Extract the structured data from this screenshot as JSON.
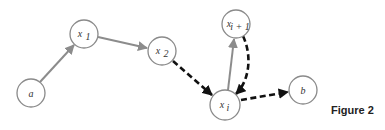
{
  "figure": {
    "label": "Figure 2"
  },
  "nodes": [
    {
      "id": "a",
      "label": "a",
      "subscript": "",
      "cx": 31,
      "cy": 93,
      "r": 14
    },
    {
      "id": "x1",
      "label": "x",
      "subscript": "1",
      "cx": 84,
      "cy": 34,
      "r": 14
    },
    {
      "id": "x2",
      "label": "x",
      "subscript": "2",
      "cx": 162,
      "cy": 51,
      "r": 14
    },
    {
      "id": "xi1",
      "label": "x",
      "subscript": "i + 1",
      "cx": 236,
      "cy": 24,
      "r": 14
    },
    {
      "id": "xi",
      "label": "x",
      "subscript": "i",
      "cx": 225,
      "cy": 105,
      "r": 15
    },
    {
      "id": "b",
      "label": "b",
      "subscript": "",
      "cx": 303,
      "cy": 90,
      "r": 14
    }
  ],
  "edges": [
    {
      "from": "a",
      "to": "x1",
      "style": "solid-gray"
    },
    {
      "from": "x1",
      "to": "x2",
      "style": "solid-gray"
    },
    {
      "from": "x2",
      "to": "xi",
      "style": "dashed-black"
    },
    {
      "from": "xi",
      "to": "xi1",
      "style": "solid-gray"
    },
    {
      "from": "xi1",
      "to": "xi",
      "style": "dashed-black-curved"
    },
    {
      "from": "xi",
      "to": "b",
      "style": "dashed-black"
    }
  ],
  "colors": {
    "solid_edge": "#8c8c8c",
    "dashed_edge": "#111111",
    "node_stroke": "#8a8a8a"
  }
}
